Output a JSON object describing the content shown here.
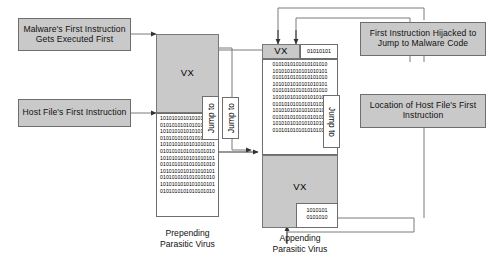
{
  "diagram": {
    "title_hidden": "Prepending and Appending Parasitic Virus Infection Diagram",
    "callouts": {
      "malware_first": "Malware's First Instruction\nGets Executed First",
      "host_first": "Host File's First Instruction",
      "hijacked": "First Instruction Hijacked to\nJump to Malware Code",
      "location_host": "Location of Host File's First\nInstruction"
    },
    "labels": {
      "vx": "VX",
      "jump_to": "Jump to",
      "prepending_caption": "Prepending\nParasitic Virus",
      "appending_caption": "Appending\nParasitic Virus"
    },
    "binary": {
      "prepending_body": "1010101010101010101\n0101010101010101010\n1010101010101010101\n0101010101010101010\n1010101010101010101\n0101010101010101010\n1010101010101010101\n0101010101010101010\n1010101010101010101\n0101010101010101010\n1010101010101010101\n0101010101010101010",
      "appending_head": "01010101",
      "appending_body": "0101010101010101010\n1010101010101010101\n0101010101010101010\n1010101010101010101\n0101010101010101010\n1010101010101010101\n0101010101010101010\n1010101010101010101\n0101010101010101010\n1010101010101010101\n0101010101010101010",
      "appending_footer": "1010101\n0101010"
    },
    "colors": {
      "fill_gray": "#c9c9c9",
      "stroke": "#6e6e6e",
      "line": "#7a7a7a",
      "background": "#ffffff",
      "text": "#111111"
    }
  }
}
